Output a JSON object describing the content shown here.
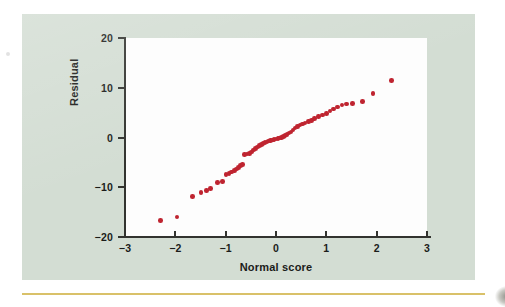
{
  "figure": {
    "panel_color": "#d3ddd3",
    "plot_background": "#fdfdfd",
    "marker_color": "#bf2430",
    "axis_color": "#32332f",
    "rule_color": "#d9c169"
  },
  "chart_data": {
    "type": "scatter",
    "title": "",
    "xlabel": "Normal score",
    "ylabel": "Residual",
    "xlim": [
      -3,
      3
    ],
    "ylim": [
      -20,
      20
    ],
    "grid": false,
    "legend": null,
    "xticks": [
      -3,
      -2,
      -1,
      0,
      1,
      2,
      3
    ],
    "xticklabels": [
      "−3",
      "−2",
      "−1",
      "0",
      "1",
      "2",
      "3"
    ],
    "yticks": [
      -20,
      -10,
      0,
      10,
      20
    ],
    "yticklabels": [
      "−20",
      "−10",
      "0",
      "10",
      "20"
    ],
    "series": [
      {
        "name": "residuals",
        "marker": "circle",
        "color": "#bf2430",
        "points": [
          [
            -2.3,
            -16.7
          ],
          [
            -1.97,
            -16.0
          ],
          [
            -1.66,
            -11.8
          ],
          [
            -1.49,
            -11.0
          ],
          [
            -1.38,
            -10.6
          ],
          [
            -1.3,
            -10.2
          ],
          [
            -1.16,
            -9.1
          ],
          [
            -1.06,
            -8.8
          ],
          [
            -0.99,
            -7.4
          ],
          [
            -0.93,
            -7.2
          ],
          [
            -0.88,
            -6.9
          ],
          [
            -0.83,
            -6.6
          ],
          [
            -0.79,
            -6.3
          ],
          [
            -0.74,
            -6.0
          ],
          [
            -0.7,
            -5.6
          ],
          [
            -0.66,
            -5.4
          ],
          [
            -0.62,
            -3.4
          ],
          [
            -0.58,
            -3.3
          ],
          [
            -0.53,
            -3.2
          ],
          [
            -0.49,
            -2.9
          ],
          [
            -0.45,
            -2.5
          ],
          [
            -0.41,
            -2.2
          ],
          [
            -0.37,
            -1.9
          ],
          [
            -0.33,
            -1.6
          ],
          [
            -0.29,
            -1.4
          ],
          [
            -0.26,
            -1.2
          ],
          [
            -0.22,
            -1.0
          ],
          [
            -0.18,
            -0.9
          ],
          [
            -0.15,
            -0.7
          ],
          [
            -0.11,
            -0.6
          ],
          [
            -0.07,
            -0.5
          ],
          [
            -0.04,
            -0.4
          ],
          [
            0.0,
            -0.3
          ],
          [
            0.04,
            -0.2
          ],
          [
            0.07,
            -0.1
          ],
          [
            0.11,
            0.0
          ],
          [
            0.15,
            0.2
          ],
          [
            0.18,
            0.4
          ],
          [
            0.22,
            0.6
          ],
          [
            0.26,
            0.9
          ],
          [
            0.3,
            1.1
          ],
          [
            0.34,
            1.5
          ],
          [
            0.38,
            1.9
          ],
          [
            0.43,
            2.2
          ],
          [
            0.48,
            2.5
          ],
          [
            0.53,
            2.7
          ],
          [
            0.58,
            2.9
          ],
          [
            0.64,
            3.2
          ],
          [
            0.7,
            3.4
          ],
          [
            0.77,
            3.8
          ],
          [
            0.84,
            4.2
          ],
          [
            0.92,
            4.5
          ],
          [
            1.0,
            4.8
          ],
          [
            1.07,
            5.3
          ],
          [
            1.14,
            5.7
          ],
          [
            1.22,
            6.1
          ],
          [
            1.31,
            6.5
          ],
          [
            1.4,
            6.7
          ],
          [
            1.52,
            6.8
          ],
          [
            1.72,
            7.2
          ],
          [
            1.93,
            8.9
          ],
          [
            2.3,
            11.5
          ]
        ]
      }
    ]
  }
}
